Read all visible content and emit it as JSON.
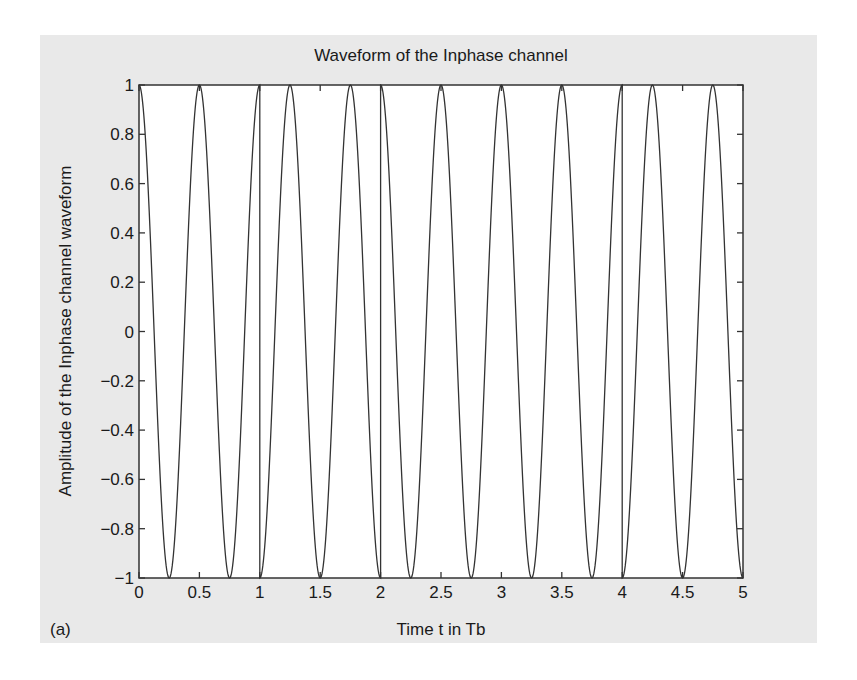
{
  "figure": {
    "panel_label": "(a)",
    "background": "#e9e9e9",
    "line_color": "#333333"
  },
  "chart_data": {
    "type": "line",
    "title": "Waveform of the Inphase channel",
    "xlabel": "Time t in Tb",
    "ylabel": "Amplitude of the Inphase channel waveform",
    "xlim": [
      0,
      5
    ],
    "ylim": [
      -1,
      1
    ],
    "grid": false,
    "legend": null,
    "xticks": [
      0,
      0.5,
      1,
      1.5,
      2,
      2.5,
      3,
      3.5,
      4,
      4.5,
      5
    ],
    "xtick_labels": [
      "0",
      "0.5",
      "1",
      "1.5",
      "2",
      "2.5",
      "3",
      "3.5",
      "4",
      "4.5",
      "5"
    ],
    "yticks": [
      -1,
      -0.8,
      -0.6,
      -0.4,
      -0.2,
      0,
      0.2,
      0.4,
      0.6,
      0.8,
      1
    ],
    "ytick_labels": [
      "−1",
      "−0.8",
      "−0.6",
      "−0.4",
      "−0.2",
      "0",
      "0.2",
      "0.4",
      "0.6",
      "0.8",
      "1"
    ],
    "series": [
      {
        "name": "Inphase channel waveform",
        "function": "s_k * cos(2*pi*2*t), t in Tb",
        "carrier_cycles_per_Tb": 2,
        "bit_intervals": [
          {
            "t_start": 0,
            "t_end": 1,
            "sign": 1
          },
          {
            "t_start": 1,
            "t_end": 2,
            "sign": -1
          },
          {
            "t_start": 2,
            "t_end": 3,
            "sign": 1
          },
          {
            "t_start": 3,
            "t_end": 4,
            "sign": 1
          },
          {
            "t_start": 4,
            "t_end": 5,
            "sign": -1
          }
        ],
        "peaks_t": [
          0,
          0.5,
          1.0,
          1.25,
          1.75,
          2.0,
          2.5,
          3.0,
          3.5,
          4.0,
          4.25,
          4.75
        ],
        "troughs_t": [
          0.25,
          0.75,
          1.0,
          1.5,
          2.0,
          2.75,
          3.25,
          3.75,
          4.0,
          4.5,
          5.0
        ]
      }
    ]
  }
}
